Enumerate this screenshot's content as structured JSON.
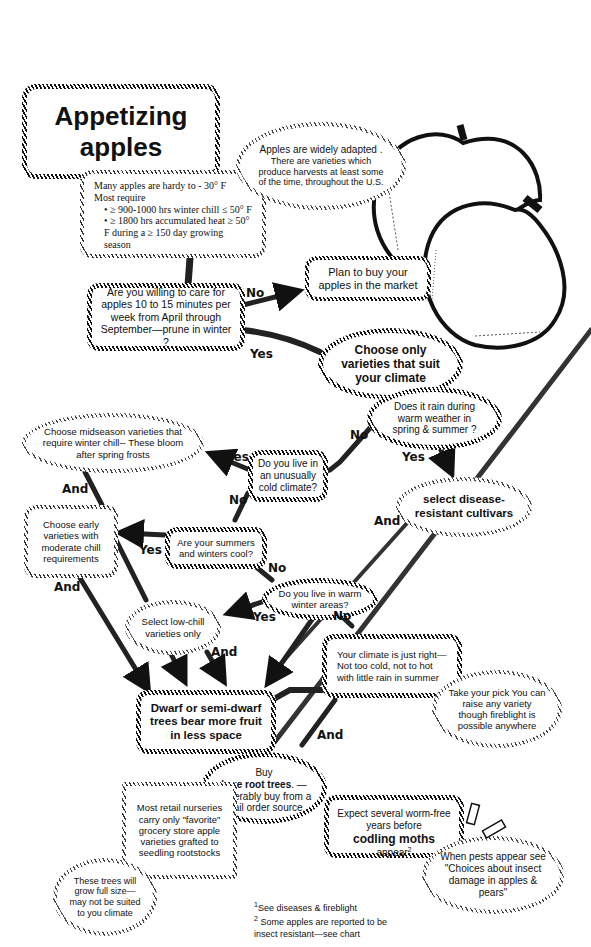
{
  "title": {
    "line1": "Appetizing",
    "line2": "apples"
  },
  "requirements": {
    "line1": "Many apples are hardy  to  - 30° F",
    "line2": "Most require",
    "bullets": [
      "≥ 900-1000 hrs winter chill ≤ 50° F",
      "≥ 1800 hrs accumulated heat ≥ 50° F during a ≥ 150 day growing season"
    ]
  },
  "adapted": {
    "line1": "Apples are widely adapted .",
    "line2": "There are varieties which produce harvests at least some of the time, throughout the U.S."
  },
  "q_care": "Are you willing to care for apples 10 to 15 minutes per week from April through September—prune in winter ?",
  "buy_market": "Plan to buy your apples in the market",
  "choose_climate": "Choose only varieties that suit your climate",
  "q_rain": "Does it rain during warm weather in spring & summer ?",
  "midseason": "Choose midseason varieties that require winter chill-- These bloom after spring frosts",
  "q_cold": "Do you live in an unusually cold climate?",
  "disease": "select disease-resistant cultivars",
  "early": "Choose early varieties with moderate chill requirements",
  "q_cool": "Are your summers and winters cool?",
  "q_warm": "Do you live in warm winter areas?",
  "lowchill": "Select low-chill varieties only",
  "just_right": "Your climate is just right— Not too cold, not to hot with little rain in summer",
  "dwarf": "Dwarf or semi-dwarf trees bear more fruit in less space",
  "take_pick": "Take your pick You can raise any variety though  fireblight is possible anywhere",
  "bare_root": {
    "pre": "Buy",
    "bold": "bare root trees",
    "post": ". —preferably buy from a mail order source"
  },
  "nurseries": "Most retail nurseries carry only \"favorite\" grocery store apple varieties grafted to seedling rootstocks",
  "full_size": "These trees will grow full size— may not be suited to you climate",
  "codling": {
    "pre": "Expect several worm-free years before",
    "bold": "codling moths",
    "post": " appear",
    "sup": "2"
  },
  "pests": "When pests appear see \"Choices about insect damage in apples & pears\"",
  "labels": {
    "no": "No",
    "yes": "Yes",
    "and": "And"
  },
  "footnotes": [
    {
      "num": "1",
      "text": "See diseases &  fireblight"
    },
    {
      "num": "2",
      "text": "Some apples are reported to be insect resistant—see chart"
    }
  ]
}
